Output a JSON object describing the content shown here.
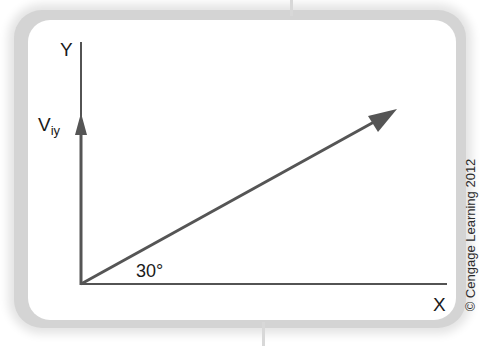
{
  "diagram": {
    "axes": {
      "y_label": "Y",
      "x_label": "X"
    },
    "vectors": {
      "vertical_component_label": "V",
      "vertical_component_subscript": "iy",
      "velocity_vector_angle": "30°"
    },
    "copyright": "© Cengage Learning 2012",
    "colors": {
      "axis": "#1a1a1a",
      "vector": "#555555",
      "frame": "#d4d4d4"
    }
  }
}
